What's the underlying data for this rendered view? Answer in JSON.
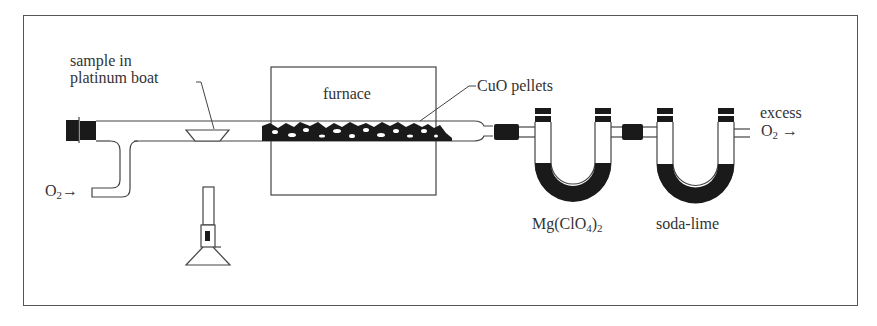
{
  "diagram": {
    "labels": {
      "sample": [
        "sample in",
        "platinum boat"
      ],
      "furnace": "furnace",
      "cuo": "CuO pellets",
      "o2_in_main": "O",
      "o2_in_sub": "2",
      "o2_in_arrow": "→",
      "mgclo4_main": "Mg(ClO",
      "mgclo4_sub1": "4",
      "mgclo4_close": ")",
      "mgclo4_sub2": "2",
      "sodalime": "soda-lime",
      "excess": "excess",
      "o2_out_main": "O",
      "o2_out_sub": "2",
      "o2_out_arrow": "→"
    },
    "colors": {
      "ink": "#1a1a1a",
      "line": "#444444",
      "fill": "#ffffff"
    }
  }
}
